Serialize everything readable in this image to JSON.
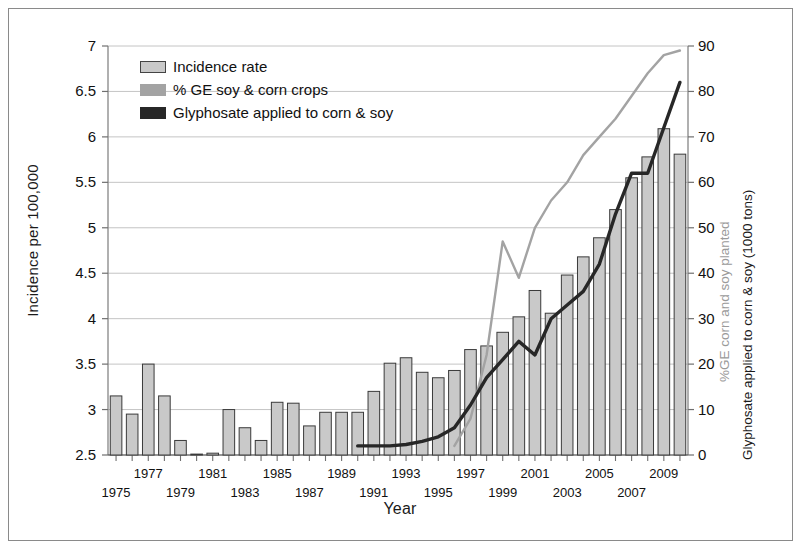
{
  "figure": {
    "legend": [
      {
        "key": "incidence",
        "label": "Incidence rate",
        "swatch": "bar-swatch",
        "color": "#c9c9c9"
      },
      {
        "key": "ge",
        "label": "% GE soy & corn crops",
        "swatch": "line-swatch",
        "color": "#a3a3a3"
      },
      {
        "key": "glyphosate",
        "label": "Glyphosate applied to corn & soy",
        "swatch": "line-swatch",
        "color": "#272727"
      }
    ]
  },
  "chart_data": {
    "type": "bar",
    "title": "",
    "xlabel": "Year",
    "ylabel": "Incidence per 100,000",
    "ylabel_right_secondary": "%GE corn and soy planted",
    "ylabel_right": "Glyphosate applied to corn & soy (1000 tons)",
    "grid": true,
    "legend_position": "top-left",
    "ylim": [
      2.5,
      7
    ],
    "yticks": [
      2.5,
      3,
      3.5,
      4,
      4.5,
      5,
      5.5,
      6,
      6.5,
      7
    ],
    "ylim_right": [
      0,
      90
    ],
    "yticks_right": [
      0,
      10,
      20,
      30,
      40,
      50,
      60,
      70,
      80,
      90
    ],
    "xlim": [
      1974.5,
      2010.5
    ],
    "categories": [
      1975,
      1976,
      1977,
      1978,
      1979,
      1980,
      1981,
      1982,
      1983,
      1984,
      1985,
      1986,
      1987,
      1988,
      1989,
      1990,
      1991,
      1992,
      1993,
      1994,
      1995,
      1996,
      1997,
      1998,
      1999,
      2000,
      2001,
      2002,
      2003,
      2004,
      2005,
      2006,
      2007,
      2008,
      2009,
      2010
    ],
    "xticklabels_row1": [
      1977,
      1981,
      1985,
      1989,
      1993,
      1997,
      2001,
      2005,
      2009
    ],
    "xticklabels_row2": [
      1975,
      1979,
      1983,
      1987,
      1991,
      1995,
      1999,
      2003,
      2007
    ],
    "series": [
      {
        "name": "Incidence rate",
        "type": "bar",
        "axis": "left",
        "color": "#c9c9c9",
        "edge": "#3a3a3a",
        "values": [
          3.15,
          2.95,
          3.5,
          3.15,
          2.66,
          2.51,
          2.52,
          3.0,
          2.8,
          2.66,
          3.08,
          3.07,
          2.82,
          2.97,
          2.97,
          2.97,
          3.2,
          3.51,
          3.57,
          3.41,
          3.35,
          3.43,
          3.66,
          3.7,
          3.85,
          4.02,
          4.31,
          4.06,
          4.48,
          4.68,
          4.89,
          5.2,
          5.55,
          5.78,
          6.09,
          5.81
        ]
      },
      {
        "name": "% GE soy & corn crops",
        "type": "line",
        "axis": "right",
        "color": "#a3a3a3",
        "values": [
          null,
          null,
          null,
          null,
          null,
          null,
          null,
          null,
          null,
          null,
          null,
          null,
          null,
          null,
          null,
          null,
          null,
          null,
          null,
          null,
          null,
          2,
          8,
          22,
          47,
          39,
          50,
          56,
          60,
          66,
          70,
          74,
          79,
          84,
          88,
          89
        ]
      },
      {
        "name": "Glyphosate applied to corn & soy",
        "type": "line",
        "axis": "right",
        "color": "#272727",
        "values": [
          null,
          null,
          null,
          null,
          null,
          null,
          null,
          null,
          null,
          null,
          null,
          null,
          null,
          null,
          null,
          2,
          2,
          2,
          2.3,
          3,
          4,
          6,
          11,
          17,
          21,
          25,
          22,
          30,
          33,
          36,
          42,
          53,
          62,
          62,
          72,
          82
        ]
      }
    ],
    "notes": [
      "Bar series uses left axis (incidence per 100,000).",
      "Both line series use right axis (0-90).",
      "2009 bar is the tallest at about 7.0 and 2010 bar about 6.6."
    ]
  }
}
